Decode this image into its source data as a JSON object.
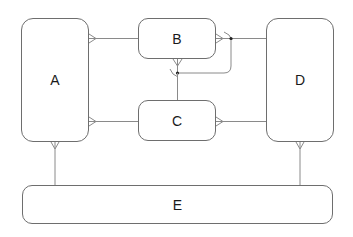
{
  "diagram": {
    "type": "entity-relationship",
    "colors": {
      "stroke": "#6e6e6e",
      "connector": "#8a8a8a",
      "text": "#1a1a1a",
      "background": "#ffffff"
    },
    "entities": [
      {
        "id": "A",
        "label": "A"
      },
      {
        "id": "B",
        "label": "B"
      },
      {
        "id": "C",
        "label": "C"
      },
      {
        "id": "D",
        "label": "D"
      },
      {
        "id": "E",
        "label": "E"
      }
    ],
    "relationships": [
      {
        "from": "A",
        "to": "B",
        "from_end": "crow-foot-many",
        "to_end": "none"
      },
      {
        "from": "A",
        "to": "C",
        "from_end": "crow-foot-many",
        "to_end": "none"
      },
      {
        "from": "B",
        "to": "D",
        "from_end": "crow-foot-many",
        "to_end": "none"
      },
      {
        "from": "C",
        "to": "D",
        "from_end": "crow-foot-many",
        "to_end": "none"
      },
      {
        "from": "B",
        "to": "B",
        "from_end": "crow-foot-many",
        "to_end": "crow-foot-many",
        "note": "self-loop"
      },
      {
        "from": "B",
        "to": "C",
        "from_end": "none",
        "to_end": "none"
      },
      {
        "from": "A",
        "to": "E",
        "from_end": "crow-foot-many",
        "to_end": "none"
      },
      {
        "from": "D",
        "to": "E",
        "from_end": "crow-foot-many",
        "to_end": "none"
      }
    ]
  }
}
